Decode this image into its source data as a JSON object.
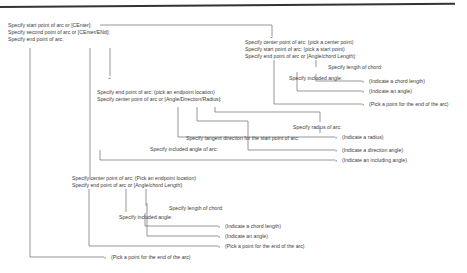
{
  "block1": {
    "lines": [
      "Specify start point of arc or [CEnter]:",
      "Specify second point of arc or [CEnter/ENd]:",
      "Specify end point of arc:"
    ]
  },
  "block2": {
    "lines": [
      "Specify center point of arc: (pick a center point)",
      "Specify start point of arc: (pick a start point)",
      "Specify end point of arc or [Angle/chord Length]:"
    ],
    "length_prompt": "Specify length of chord:",
    "angle_prompt": "Specify included angle:",
    "results": [
      "(Indicate a chord length)",
      "(Indicate an angle)",
      "(Pick a point for the end of the arc)"
    ]
  },
  "block3": {
    "lines": [
      "Specify end point of arc: (pick an endpoint location)",
      "Specify center point of arc or [Angle/Direction/Radius]:"
    ],
    "radius_prompt": "Specify radius of arc:",
    "tangent_prompt": "Specify tangent direction for the start point of arc:",
    "included_prompt": "Specify included angle of arc:",
    "results": [
      "(Indicate a radius)",
      "(Indicate a direction angle)",
      "(Indicate an including angle)"
    ]
  },
  "block4": {
    "lines": [
      "Specify center point of arc: (Pick an endpoint location)",
      "Specify end point of arc or [Angle/chord Length]:"
    ],
    "length_prompt": "Specify length of chord:",
    "angle_prompt": "Specify included angle:",
    "results": [
      "(Indicate a chord length)",
      "(Indicate an angle)",
      "(Pick a point for the end of the arc)"
    ]
  },
  "final_result": "(Pick a point for the end of the arc)"
}
